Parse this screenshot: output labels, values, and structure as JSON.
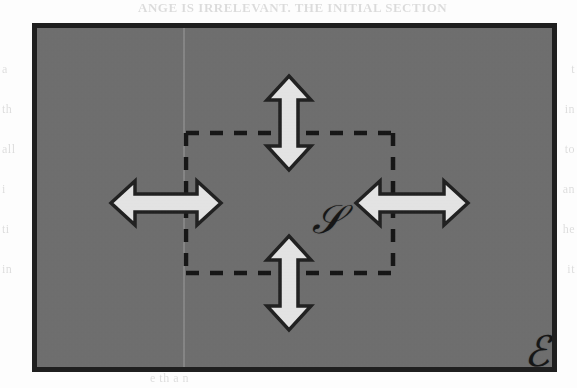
{
  "figure": {
    "type": "system-environment-block-diagram",
    "environment": {
      "label": "ℰ",
      "label_meaning": "environment",
      "fill_color": "#6e6e6e",
      "border_color": "#1f1f1f",
      "border_width_px": 5
    },
    "system": {
      "label": "𝒮",
      "label_meaning": "system",
      "boundary_style": "dashed",
      "boundary_color": "#141414"
    },
    "arrows": [
      {
        "name": "top-arrow",
        "direction": "vertical",
        "heads": "double",
        "crosses": "top-boundary",
        "fill": "#e8e8e8",
        "outline": "#1f1f1f"
      },
      {
        "name": "bottom-arrow",
        "direction": "vertical",
        "heads": "double",
        "crosses": "bottom-boundary",
        "fill": "#e8e8e8",
        "outline": "#1f1f1f"
      },
      {
        "name": "left-arrow",
        "direction": "horizontal",
        "heads": "double",
        "crosses": "left-boundary",
        "fill": "#e8e8e8",
        "outline": "#1f1f1f"
      },
      {
        "name": "right-arrow",
        "direction": "horizontal",
        "heads": "double",
        "crosses": "right-boundary",
        "fill": "#e8e8e8",
        "outline": "#1f1f1f"
      }
    ]
  },
  "scan_artifacts": {
    "top_line": "ANGE IS IRRELEVANT. THE INITIAL SECTION",
    "left_lines": [
      "a",
      "th",
      "all",
      "i",
      "ti",
      "in"
    ],
    "right_lines": [
      "t",
      "in",
      "to",
      "an",
      "he",
      "it"
    ],
    "bottom_line": "e th a n"
  }
}
